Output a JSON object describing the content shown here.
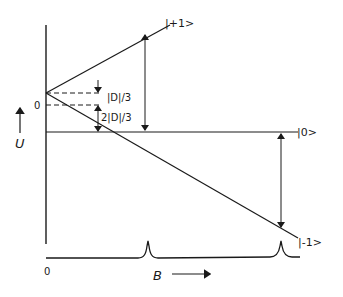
{
  "diagram": {
    "y_axis": {
      "label": "U",
      "zero_label": "0"
    },
    "x_axis": {
      "label": "B",
      "zero_label": "0"
    },
    "levels": [
      {
        "name": "plus_one",
        "label": "|+1>"
      },
      {
        "name": "zero",
        "label": "|0>"
      },
      {
        "name": "minus_one",
        "label": "|-1>"
      }
    ],
    "annotations": {
      "d_third": "|D|/3",
      "two_d_third": "2|D|/3"
    },
    "spectrum": {
      "peaks": 2
    }
  }
}
